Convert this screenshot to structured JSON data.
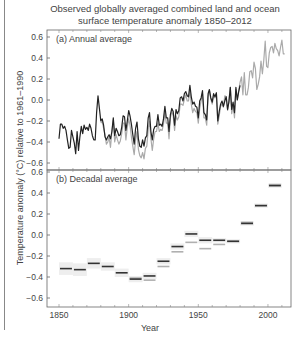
{
  "chart_data": {
    "type": "line",
    "title": "Observed globally averaged combined land and ocean surface temperature anomaly 1850–2012",
    "title_lines": [
      "Observed globally averaged combined land and ocean",
      "surface temperature anomaly 1850–2012"
    ],
    "xlabel": "Year",
    "ylabel": "Temperature anomaly (°C) relative to 1961–1990",
    "xlim": [
      1841,
      2017
    ],
    "x_ticks": [
      1850,
      1900,
      1950,
      2000
    ],
    "grid": false,
    "panels": [
      {
        "id": "a",
        "label": "(a)",
        "subtitle": "Annual average",
        "type": "line",
        "ylim": [
          -0.65,
          0.62
        ],
        "y_ticks": [
          "0.6",
          "0.4",
          "0.2",
          "0.0",
          "−0.2",
          "−0.4",
          "−0.6"
        ],
        "y_tick_values": [
          0.6,
          0.4,
          0.2,
          0.0,
          -0.2,
          -0.4,
          -0.6
        ],
        "series": [
          {
            "name": "dataset-dark",
            "color": "#222222",
            "x": [
              1850,
              1851,
              1852,
              1853,
              1854,
              1855,
              1856,
              1857,
              1858,
              1859,
              1860,
              1861,
              1862,
              1863,
              1864,
              1865,
              1866,
              1867,
              1868,
              1869,
              1870,
              1871,
              1872,
              1873,
              1874,
              1875,
              1876,
              1877,
              1878,
              1879,
              1880,
              1881,
              1882,
              1883,
              1884,
              1885,
              1886,
              1887,
              1888,
              1889,
              1890,
              1891,
              1892,
              1893,
              1894,
              1895,
              1896,
              1897,
              1898,
              1899,
              1900,
              1901,
              1902,
              1903,
              1904,
              1905,
              1906,
              1907,
              1908,
              1909,
              1910,
              1911,
              1912,
              1913,
              1914,
              1915,
              1916,
              1917,
              1918,
              1919,
              1920,
              1921,
              1922,
              1923,
              1924,
              1925,
              1926,
              1927,
              1928,
              1929,
              1930,
              1931,
              1932,
              1933,
              1934,
              1935,
              1936,
              1937,
              1938,
              1939,
              1940,
              1941,
              1942,
              1943,
              1944,
              1945,
              1946,
              1947,
              1948,
              1949,
              1950,
              1951,
              1952,
              1953,
              1954,
              1955,
              1956,
              1957,
              1958,
              1959,
              1960,
              1961,
              1962,
              1963,
              1964,
              1965,
              1966,
              1967,
              1968,
              1969,
              1970,
              1971,
              1972,
              1973,
              1974,
              1975,
              1976,
              1977,
              1978,
              1979,
              1980
            ],
            "values": [
              -0.37,
              -0.23,
              -0.23,
              -0.27,
              -0.25,
              -0.29,
              -0.38,
              -0.46,
              -0.45,
              -0.29,
              -0.35,
              -0.41,
              -0.51,
              -0.3,
              -0.48,
              -0.35,
              -0.25,
              -0.32,
              -0.24,
              -0.28,
              -0.26,
              -0.29,
              -0.23,
              -0.27,
              -0.34,
              -0.38,
              -0.38,
              -0.12,
              0.04,
              -0.08,
              -0.2,
              -0.18,
              -0.24,
              -0.35,
              -0.38,
              -0.35,
              -0.33,
              -0.37,
              -0.3,
              -0.17,
              -0.34,
              -0.27,
              -0.3,
              -0.34,
              -0.33,
              -0.26,
              -0.15,
              -0.16,
              -0.29,
              -0.2,
              -0.1,
              -0.15,
              -0.23,
              -0.33,
              -0.42,
              -0.27,
              -0.21,
              -0.37,
              -0.44,
              -0.45,
              -0.38,
              -0.44,
              -0.36,
              -0.34,
              -0.17,
              -0.12,
              -0.3,
              -0.38,
              -0.28,
              -0.25,
              -0.25,
              -0.14,
              -0.24,
              -0.23,
              -0.25,
              -0.18,
              -0.06,
              -0.17,
              -0.17,
              -0.3,
              -0.14,
              -0.08,
              -0.11,
              -0.24,
              -0.09,
              -0.13,
              -0.1,
              0.02,
              0.03,
              -0.01,
              0.06,
              0.08,
              0.04,
              0.03,
              0.14,
              0.03,
              -0.04,
              -0.02,
              -0.06,
              -0.07,
              -0.17,
              -0.01,
              0.02,
              0.09,
              -0.12,
              -0.14,
              -0.19,
              0.06,
              0.1,
              0.02,
              -0.02,
              0.06,
              0.03,
              0.07,
              -0.2,
              -0.11,
              -0.04,
              -0.01,
              -0.06,
              -0.01,
              0.03,
              -0.09,
              -0.02,
              0.12,
              -0.09,
              -0.02,
              -0.12,
              0.12,
              0.0,
              0.08,
              0.14
            ]
          },
          {
            "name": "dataset-light",
            "color": "#aaaaaa",
            "x": [
              1880,
              1881,
              1882,
              1883,
              1884,
              1885,
              1886,
              1887,
              1888,
              1889,
              1890,
              1891,
              1892,
              1893,
              1894,
              1895,
              1896,
              1897,
              1898,
              1899,
              1900,
              1901,
              1902,
              1903,
              1904,
              1905,
              1906,
              1907,
              1908,
              1909,
              1910,
              1911,
              1912,
              1913,
              1914,
              1915,
              1916,
              1917,
              1918,
              1919,
              1920,
              1921,
              1922,
              1923,
              1924,
              1925,
              1926,
              1927,
              1928,
              1929,
              1930,
              1931,
              1932,
              1933,
              1934,
              1935,
              1936,
              1937,
              1938,
              1939,
              1940,
              1941,
              1942,
              1943,
              1944,
              1945,
              1946,
              1947,
              1948,
              1949,
              1950,
              1951,
              1952,
              1953,
              1954,
              1955,
              1956,
              1957,
              1958,
              1959,
              1960,
              1961,
              1962,
              1963,
              1964,
              1965,
              1966,
              1967,
              1968,
              1969,
              1970,
              1971,
              1972,
              1973,
              1974,
              1975,
              1976,
              1977,
              1978,
              1979,
              1980,
              1981,
              1982,
              1983,
              1984,
              1985,
              1986,
              1987,
              1988,
              1989,
              1990,
              1991,
              1992,
              1993,
              1994,
              1995,
              1996,
              1997,
              1998,
              1999,
              2000,
              2001,
              2002,
              2003,
              2004,
              2005,
              2006,
              2007,
              2008,
              2009,
              2010,
              2011,
              2012
            ],
            "values": [
              -0.22,
              -0.2,
              -0.27,
              -0.33,
              -0.42,
              -0.4,
              -0.35,
              -0.45,
              -0.3,
              -0.19,
              -0.4,
              -0.33,
              -0.38,
              -0.42,
              -0.39,
              -0.32,
              -0.22,
              -0.22,
              -0.38,
              -0.26,
              -0.18,
              -0.24,
              -0.35,
              -0.44,
              -0.52,
              -0.38,
              -0.3,
              -0.47,
              -0.53,
              -0.55,
              -0.5,
              -0.56,
              -0.46,
              -0.44,
              -0.28,
              -0.2,
              -0.37,
              -0.48,
              -0.37,
              -0.3,
              -0.3,
              -0.22,
              -0.3,
              -0.28,
              -0.29,
              -0.23,
              -0.12,
              -0.22,
              -0.22,
              -0.37,
              -0.17,
              -0.11,
              -0.15,
              -0.29,
              -0.15,
              -0.19,
              -0.16,
              -0.04,
              -0.04,
              -0.05,
              0.01,
              0.05,
              -0.01,
              -0.01,
              0.09,
              -0.04,
              -0.12,
              -0.08,
              -0.11,
              -0.12,
              -0.22,
              -0.08,
              -0.01,
              0.06,
              -0.17,
              -0.17,
              -0.24,
              0.03,
              0.09,
              0.01,
              -0.04,
              0.04,
              0.02,
              0.06,
              -0.23,
              -0.15,
              -0.06,
              -0.04,
              -0.07,
              0.04,
              0.03,
              -0.1,
              -0.01,
              0.12,
              -0.13,
              -0.05,
              -0.17,
              0.1,
              0.0,
              0.09,
              0.17,
              0.22,
              0.05,
              0.26,
              0.05,
              0.05,
              0.12,
              0.27,
              0.28,
              0.21,
              0.36,
              0.3,
              0.1,
              0.15,
              0.22,
              0.37,
              0.25,
              0.38,
              0.56,
              0.32,
              0.31,
              0.45,
              0.5,
              0.51,
              0.45,
              0.54,
              0.49,
              0.47,
              0.42,
              0.5,
              0.57,
              0.44,
              0.44
            ]
          }
        ]
      },
      {
        "id": "b",
        "label": "(b)",
        "subtitle": "Decadal average",
        "type": "step",
        "ylim": [
          -0.65,
          0.62
        ],
        "y_ticks": [
          "0.6",
          "0.4",
          "0.2",
          "0.0",
          "−0.2",
          "−0.4",
          "−0.6"
        ],
        "y_tick_values": [
          0.6,
          0.4,
          0.2,
          0.0,
          -0.2,
          -0.4,
          -0.6
        ],
        "decades": [
          1850,
          1860,
          1870,
          1880,
          1890,
          1900,
          1910,
          1920,
          1930,
          1940,
          1950,
          1960,
          1970,
          1980,
          1990,
          2000
        ],
        "series": [
          {
            "name": "dataset-dark",
            "color": "#333333",
            "values": [
              -0.32,
              -0.33,
              -0.27,
              -0.3,
              -0.36,
              -0.42,
              -0.39,
              -0.25,
              -0.11,
              0.01,
              -0.05,
              -0.05,
              -0.06,
              0.11,
              0.28,
              0.47
            ]
          },
          {
            "name": "dataset-light",
            "color": "#b0b0b0",
            "values": [
              null,
              null,
              null,
              null,
              null,
              -0.41,
              -0.43,
              -0.3,
              -0.16,
              -0.07,
              -0.13,
              -0.09,
              -0.06,
              0.12,
              0.28,
              0.48
            ]
          }
        ],
        "uncertainty_color": "#eeeeee",
        "uncertainty_halfwidth": [
          0.06,
          0.06,
          0.05,
          0.04,
          0.04,
          0.03,
          0.03,
          0.03,
          0.03,
          0.03,
          0.03,
          0.02,
          0.02,
          0.02,
          0.02,
          0.02
        ]
      }
    ]
  }
}
